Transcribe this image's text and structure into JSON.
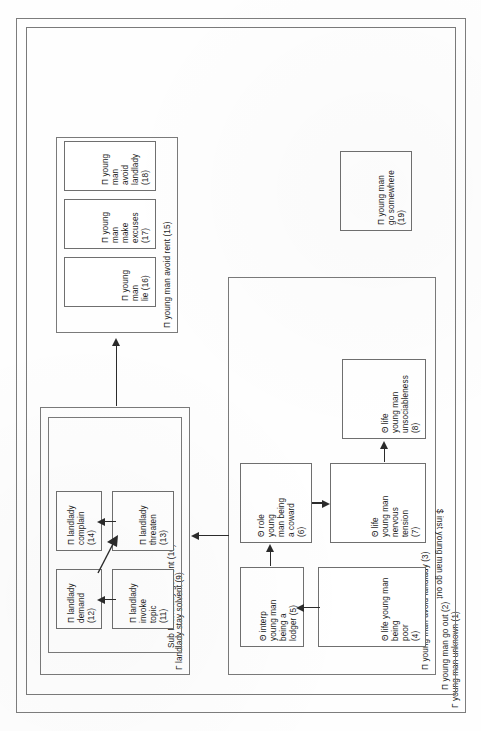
{
  "figure": {
    "orientation": "rotated-90-ccw",
    "footer_note": "$ inst young man go out"
  },
  "nodes": {
    "n1": {
      "id": "1",
      "label": "Γ young man unknown (1)",
      "kind": "goal-frame"
    },
    "n2": {
      "id": "2",
      "label": "Π young man go out (2)",
      "kind": "plan-frame"
    },
    "n3": {
      "id": "3",
      "label": "Π young man avoid landlady (3)",
      "kind": "plan-frame"
    },
    "n4": {
      "id": "4",
      "label": "Θ life young man being\npoor\n(4)",
      "kind": "theme-leaf"
    },
    "n5": {
      "id": "5",
      "label": "Θ interp\nyoung man\nbeing a\nlodger (5)",
      "kind": "theme-leaf"
    },
    "n6": {
      "id": "6",
      "label": "Θ role\nyoung\nman being\na coward\n(6)",
      "kind": "theme-leaf"
    },
    "n7": {
      "id": "7",
      "label": "Θ life\nyoung man\nnervous\ntension\n(7)",
      "kind": "theme-leaf"
    },
    "n8": {
      "id": "8",
      "label": "Θ life\nyoung man\nunsociableness\n(8)",
      "kind": "theme-leaf"
    },
    "n9": {
      "id": "9",
      "label": "Γ landlady stay solvent (9)",
      "kind": "goal-frame"
    },
    "n10": {
      "id": "10",
      "label": "Sub Γ landlady get rent (10)",
      "kind": "subgoal-frame"
    },
    "n11": {
      "id": "11",
      "label": "Π landlady\ninvoke\ntopic\n(11)",
      "kind": "plan-leaf"
    },
    "n12": {
      "id": "12",
      "label": "Π landlady\ndemand\n(12)",
      "kind": "plan-leaf"
    },
    "n13": {
      "id": "13",
      "label": "Π landlady\nthreaten\n(13)",
      "kind": "plan-leaf"
    },
    "n14": {
      "id": "14",
      "label": "Π landlady\ncomplain\n(14)",
      "kind": "plan-leaf"
    },
    "n15": {
      "id": "15",
      "label": "Π young man avoid rent (15)",
      "kind": "plan-frame"
    },
    "n16": {
      "id": "16",
      "label": "Π young man\nlie (16)",
      "kind": "plan-leaf"
    },
    "n17": {
      "id": "17",
      "label": "Π young man\nmake excuses\n(17)",
      "kind": "plan-leaf"
    },
    "n18": {
      "id": "18",
      "label": "Π young man\navoid landlady\n(18)",
      "kind": "plan-leaf"
    },
    "n19": {
      "id": "19",
      "label": "Π young man\ngo somewhere\n(19)",
      "kind": "plan-leaf"
    }
  },
  "edges": [
    {
      "from": "4",
      "to": "5",
      "style": "solid-arrow"
    },
    {
      "from": "5",
      "to": "6",
      "style": "solid-arrow"
    },
    {
      "from": "6",
      "to": "7",
      "style": "solid-arrow-thick"
    },
    {
      "from": "7",
      "to": "8",
      "style": "solid-arrow"
    },
    {
      "from": "3",
      "to": "9",
      "style": "solid-arrow"
    },
    {
      "from": "11",
      "to": "12",
      "style": "solid-arrow"
    },
    {
      "from": "12",
      "to": "13",
      "style": "solid-arrow-diagonal"
    },
    {
      "from": "13",
      "to": "14",
      "style": "solid-arrow"
    },
    {
      "from": "10",
      "to": "15",
      "style": "solid-arrow"
    }
  ],
  "colors": {
    "ink": "#1c1c1c",
    "border": "#7a7a7a",
    "leaf_border": "#6f6f6f",
    "arrow": "#2b2b2b",
    "paper": "#fefefe"
  }
}
